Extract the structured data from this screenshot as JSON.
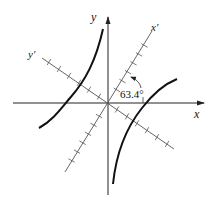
{
  "diagram": {
    "type": "rotated-axes-hyperbola",
    "axes": {
      "x_label": "x",
      "y_label": "y",
      "x_prime_label": "x′",
      "y_prime_label": "y′"
    },
    "rotation_angle_label": "63.4°",
    "rotation_angle_deg": 63.4,
    "x_prime_tick_count_each_side": 5,
    "y_prime_tick_count_each_side": 5,
    "colors": {
      "axis": "#222222",
      "rotated_axis": "#555555",
      "curve": "#111111",
      "background": "#ffffff"
    }
  }
}
